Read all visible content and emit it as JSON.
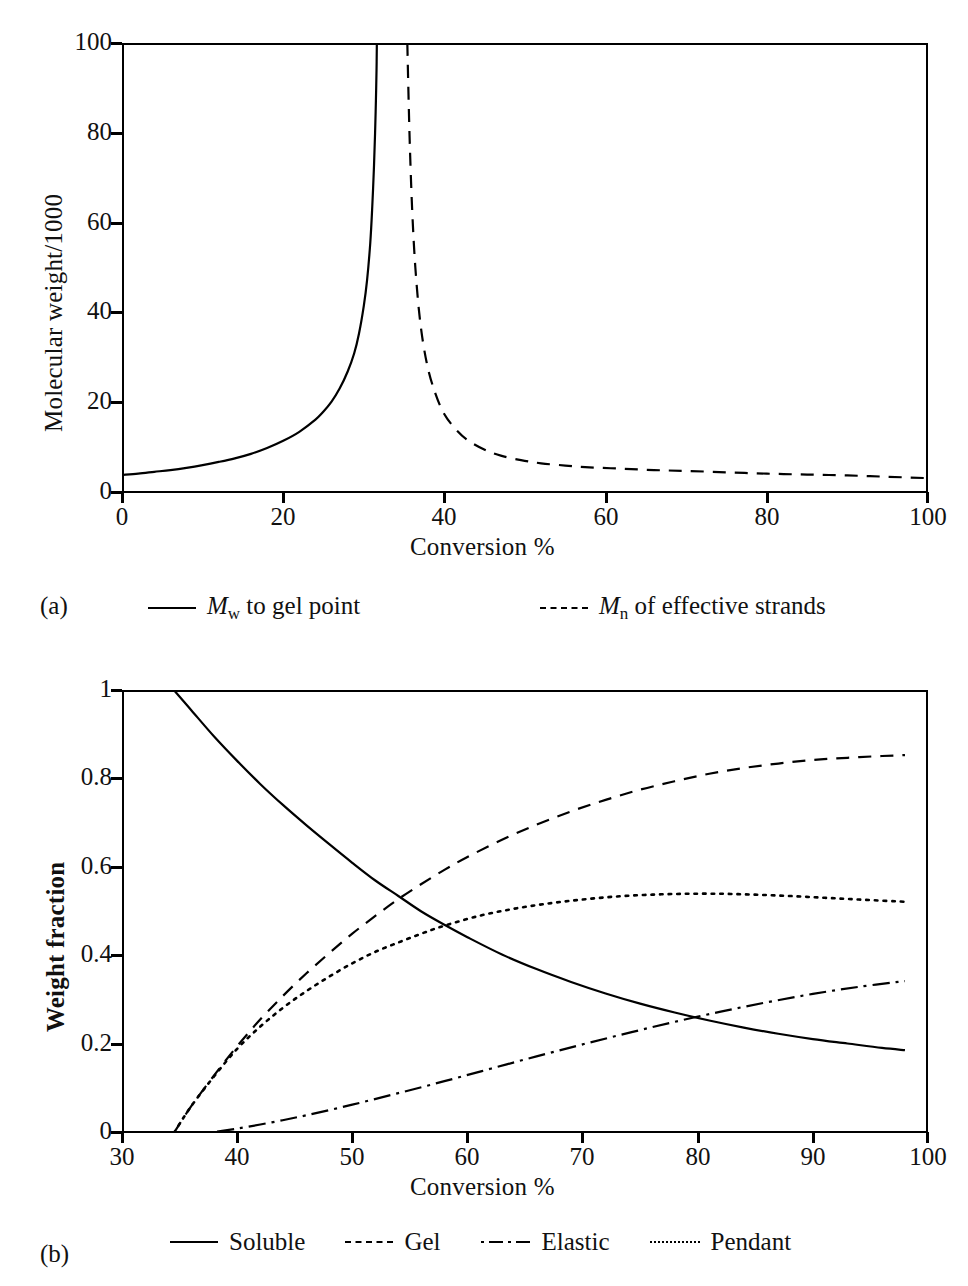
{
  "figure": {
    "panels": [
      {
        "tag": "(a)",
        "xlabel": "Conversion %",
        "ylabel": "Molecular weight/1000",
        "xticks": [
          "0",
          "20",
          "40",
          "60",
          "80",
          "100"
        ],
        "yticks": [
          "0",
          "20",
          "40",
          "60",
          "80",
          "100"
        ],
        "legend": [
          {
            "style": "solid",
            "label_prefix": "M",
            "label_sub": "w",
            "label_rest": " to gel point"
          },
          {
            "style": "dashed",
            "label_prefix": "M",
            "label_sub": "n",
            "label_rest": " of effective strands"
          }
        ]
      },
      {
        "tag": "(b)",
        "xlabel": "Conversion %",
        "ylabel": "Weight fraction",
        "xticks": [
          "30",
          "40",
          "50",
          "60",
          "70",
          "80",
          "90",
          "100"
        ],
        "yticks": [
          "0",
          "0.2",
          "0.4",
          "0.6",
          "0.8",
          "1"
        ],
        "legend": [
          {
            "style": "solid",
            "label": "Soluble"
          },
          {
            "style": "dashed",
            "label": "Gel"
          },
          {
            "style": "dashdot",
            "label": "Elastic"
          },
          {
            "style": "dotted",
            "label": "Pendant"
          }
        ]
      }
    ]
  },
  "chart_data": [
    {
      "type": "line",
      "title": "",
      "panel": "(a)",
      "xlabel": "Conversion %",
      "ylabel": "Molecular weight/1000",
      "xlim": [
        0,
        100
      ],
      "ylim": [
        0,
        100
      ],
      "xticks": [
        0,
        20,
        40,
        60,
        80,
        100
      ],
      "yticks": [
        0,
        20,
        40,
        60,
        80,
        100
      ],
      "grid": false,
      "legend_position": "below-axes",
      "gel_point_conversion": 31.6,
      "series": [
        {
          "name": "Mw to gel point",
          "style": "solid",
          "x": [
            0,
            2,
            4,
            6,
            8,
            10,
            12,
            14,
            16,
            18,
            20,
            22,
            24,
            25,
            26,
            27,
            28,
            28.8,
            29.4,
            30,
            30.4,
            30.8,
            31.05,
            31.25,
            31.4,
            31.5,
            31.58,
            31.62
          ],
          "y": [
            4.0,
            4.3,
            4.7,
            5.1,
            5.6,
            6.2,
            6.9,
            7.7,
            8.7,
            10.0,
            11.6,
            13.6,
            16.3,
            18.1,
            20.3,
            23.2,
            27.0,
            31.0,
            35.4,
            41.6,
            47.2,
            55.5,
            63.6,
            72.0,
            80.0,
            87.0,
            94.0,
            100.0
          ]
        },
        {
          "name": "Mn of effective strands",
          "style": "dashed",
          "x": [
            35.4,
            35.5,
            35.7,
            36.0,
            36.4,
            37.0,
            37.8,
            38.8,
            40.0,
            41.5,
            43.0,
            45.0,
            47.0,
            49.5,
            52.0,
            55.0,
            58.0,
            62.0,
            66.0,
            70.0,
            75.0,
            80.0,
            85.0,
            90.0,
            95.0,
            100.0
          ],
          "y": [
            100.0,
            92.0,
            78.0,
            63.0,
            50.0,
            38.0,
            29.0,
            22.5,
            17.5,
            14.0,
            11.6,
            9.6,
            8.3,
            7.3,
            6.6,
            6.1,
            5.7,
            5.4,
            5.1,
            4.9,
            4.6,
            4.3,
            4.1,
            3.9,
            3.6,
            3.3
          ]
        }
      ]
    },
    {
      "type": "line",
      "title": "",
      "panel": "(b)",
      "xlabel": "Conversion %",
      "ylabel": "Weight fraction",
      "xlim": [
        30,
        100
      ],
      "ylim": [
        0,
        1
      ],
      "xticks": [
        30,
        40,
        50,
        60,
        70,
        80,
        90,
        100
      ],
      "yticks": [
        0,
        0.2,
        0.4,
        0.6,
        0.8,
        1
      ],
      "grid": false,
      "legend_position": "below-axes",
      "series": [
        {
          "name": "Soluble",
          "style": "solid",
          "x": [
            34.5,
            36,
            38,
            40,
            42,
            44,
            46,
            48,
            50,
            52,
            54,
            56,
            58,
            60,
            63,
            66,
            69,
            72,
            75,
            78,
            81,
            84,
            87,
            90,
            93,
            96,
            98
          ],
          "y": [
            1.0,
            0.955,
            0.895,
            0.84,
            0.788,
            0.74,
            0.695,
            0.652,
            0.61,
            0.57,
            0.535,
            0.5,
            0.47,
            0.442,
            0.403,
            0.37,
            0.341,
            0.315,
            0.292,
            0.272,
            0.254,
            0.238,
            0.224,
            0.212,
            0.202,
            0.192,
            0.187
          ]
        },
        {
          "name": "Gel",
          "style": "dashed",
          "x": [
            34.5,
            36,
            38,
            40,
            42,
            44,
            46,
            48,
            50,
            52,
            54,
            56,
            58,
            60,
            63,
            66,
            69,
            72,
            75,
            78,
            81,
            84,
            87,
            90,
            93,
            96,
            98
          ],
          "y": [
            0.0,
            0.06,
            0.13,
            0.196,
            0.256,
            0.31,
            0.36,
            0.406,
            0.45,
            0.49,
            0.528,
            0.562,
            0.594,
            0.623,
            0.662,
            0.696,
            0.726,
            0.752,
            0.775,
            0.794,
            0.811,
            0.824,
            0.834,
            0.842,
            0.847,
            0.851,
            0.853
          ]
        },
        {
          "name": "Elastic",
          "style": "dashdot",
          "x": [
            37.5,
            40,
            43,
            46,
            50,
            54,
            58,
            62,
            66,
            70,
            74,
            78,
            82,
            86,
            90,
            94,
            98
          ],
          "y": [
            0.0,
            0.01,
            0.024,
            0.04,
            0.064,
            0.09,
            0.117,
            0.145,
            0.173,
            0.2,
            0.226,
            0.251,
            0.274,
            0.295,
            0.314,
            0.33,
            0.343
          ]
        },
        {
          "name": "Pendant",
          "style": "dotted",
          "x": [
            34.5,
            36,
            38,
            40,
            42,
            44,
            46,
            48,
            50,
            52,
            54,
            56,
            58,
            61,
            64,
            67,
            70,
            73,
            76,
            79,
            82,
            85,
            88,
            91,
            94,
            98
          ],
          "y": [
            0.0,
            0.06,
            0.128,
            0.19,
            0.24,
            0.283,
            0.32,
            0.353,
            0.383,
            0.409,
            0.43,
            0.45,
            0.468,
            0.49,
            0.506,
            0.518,
            0.527,
            0.534,
            0.538,
            0.54,
            0.54,
            0.538,
            0.535,
            0.531,
            0.527,
            0.522
          ]
        }
      ]
    }
  ]
}
